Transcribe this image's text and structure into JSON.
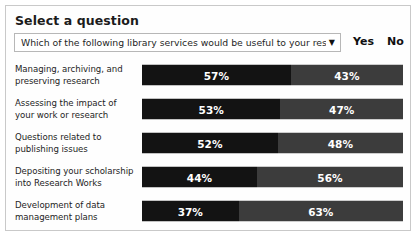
{
  "header": {
    "title": "Select a question"
  },
  "question_select": {
    "value": "Which of the following library services would be useful to your research",
    "arrow_glyph": "▼"
  },
  "legend": {
    "yes": "Yes",
    "no": "No"
  },
  "colors": {
    "yes_bar": "#131313",
    "no_bar": "#3c3c3c",
    "card_border": "#c9c9c9",
    "background": "#ffffff"
  },
  "chart_data": {
    "type": "bar",
    "title": "Select a question",
    "subtitle": "Which of the following library services would be useful to your research",
    "orientation": "horizontal",
    "stacked": true,
    "normalized": true,
    "xlabel": "",
    "ylabel": "",
    "xlim": [
      0,
      100
    ],
    "grid": false,
    "legend_position": "top-right",
    "categories": [
      "Managing, archiving, and preserving research",
      "Assessing the impact of your work or research",
      "Questions related to publishing issues",
      "Depositing your scholarship into Research Works",
      "Development of data management plans"
    ],
    "series": [
      {
        "name": "Yes",
        "values": [
          57,
          53,
          52,
          44,
          37
        ]
      },
      {
        "name": "No",
        "values": [
          43,
          47,
          48,
          56,
          63
        ]
      }
    ]
  },
  "rows": [
    {
      "label_line1": "Managing, archiving, and",
      "label_line2": "preserving research",
      "yes": 57,
      "no": 43,
      "yes_label": "57%",
      "no_label": "43%"
    },
    {
      "label_line1": "Assessing the impact of",
      "label_line2": "your work or research",
      "yes": 53,
      "no": 47,
      "yes_label": "53%",
      "no_label": "47%"
    },
    {
      "label_line1": "Questions related to",
      "label_line2": "publishing issues",
      "yes": 52,
      "no": 48,
      "yes_label": "52%",
      "no_label": "48%"
    },
    {
      "label_line1": "Depositing your scholarship",
      "label_line2": "into Research Works",
      "yes": 44,
      "no": 56,
      "yes_label": "44%",
      "no_label": "56%"
    },
    {
      "label_line1": "Development of data",
      "label_line2": "management plans",
      "yes": 37,
      "no": 63,
      "yes_label": "37%",
      "no_label": "63%"
    }
  ]
}
